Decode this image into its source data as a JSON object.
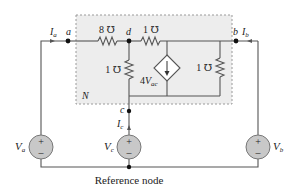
{
  "diagram": {
    "type": "circuit",
    "network_label": "N",
    "nodes": {
      "a": "a",
      "b": "b",
      "c": "c",
      "d": "d"
    },
    "currents": {
      "Ia_base": "I",
      "Ia_sub": "a",
      "Ib_base": "I",
      "Ib_sub": "b",
      "Ic_base": "I",
      "Ic_sub": "c"
    },
    "resistors": [
      {
        "id": "R_ad",
        "label": "8 ℧"
      },
      {
        "id": "R_d_right",
        "label": "1 ℧"
      },
      {
        "id": "R_d_down",
        "label": "1 ℧"
      },
      {
        "id": "R_right",
        "label": "1 ℧"
      }
    ],
    "dependent_source": {
      "coef": "4",
      "var_base": "V",
      "var_sub": "ac"
    },
    "sources": [
      {
        "id": "Va",
        "base": "V",
        "sub": "a",
        "plus": "+",
        "minus": "–"
      },
      {
        "id": "Vc",
        "base": "V",
        "sub": "c",
        "plus": "+",
        "minus": "–"
      },
      {
        "id": "Vb",
        "base": "V",
        "sub": "b",
        "plus": "+",
        "minus": "–"
      }
    ],
    "reference_label": "Reference node",
    "colors": {
      "wire": "#555555",
      "box_fill": "#ededed",
      "box_border": "#9a9a9a",
      "source_fill": "#c8c8c8",
      "text": "#222222"
    }
  }
}
